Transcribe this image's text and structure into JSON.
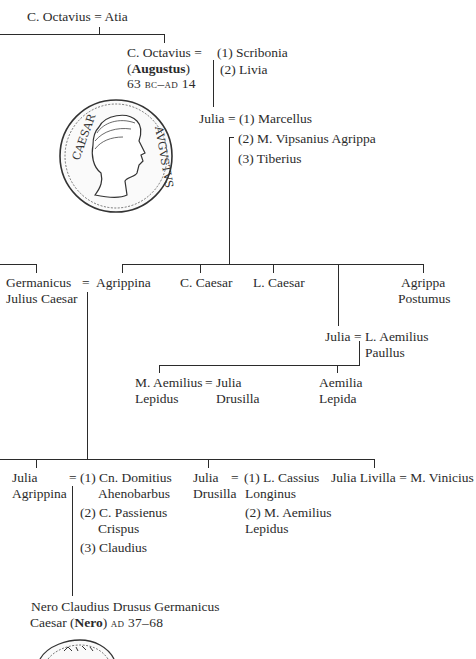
{
  "gen1": {
    "father": "C. Octavius",
    "eq": "=",
    "mother": "Atia"
  },
  "augustus": {
    "name": "C. Octavius",
    "eq": "=",
    "title_open": "(",
    "title": "Augustus",
    "title_close": ")",
    "dates": "63 bc–ad 14",
    "wives": [
      "(1) Scribonia",
      "(2) Livia"
    ]
  },
  "julia": {
    "name": "Julia",
    "eq": "=",
    "husbands": [
      "(1) Marcellus",
      "(2) M. Vipsanius Agrippa",
      "(3) Tiberius"
    ]
  },
  "coin_top": {
    "legend_left": "CAESAR",
    "legend_right": "AVGVSTVS",
    "subject": "Augustus portrait coin"
  },
  "gen3": {
    "germanicus": [
      "Germanicus",
      "Julius Caesar"
    ],
    "eq": "=",
    "agrippina": "Agrippina",
    "c_caesar": "C. Caesar",
    "l_caesar": "L. Caesar",
    "agrippa_postumus": [
      "Agrippa",
      "Postumus"
    ]
  },
  "julia_minor": {
    "name": "Julia",
    "eq": "=",
    "husband": [
      "L. Aemilius",
      "Paullus"
    ]
  },
  "gen4b": {
    "lepidus": [
      "M. Aemilius",
      "Lepidus"
    ],
    "eq": "=",
    "drusilla": [
      "Julia",
      "Drusilla"
    ],
    "aemilia": [
      "Aemilia",
      "Lepida"
    ]
  },
  "gen4": {
    "agrippina_minor": [
      "Julia",
      "Agrippina"
    ],
    "eq1": "=",
    "agrippina_husbands": [
      "(1) Cn. Domitius",
      "Ahenobarbus",
      "(2) C. Passienus",
      "Crispus",
      "(3) Claudius"
    ],
    "drusilla": [
      "Julia",
      "Drusilla"
    ],
    "eq2": "=",
    "drusilla_husbands": [
      "(1) L. Cassius",
      "Longinus",
      "(2) M. Aemilius",
      "Lepidus"
    ],
    "livilla": "Julia Livilla",
    "eq3": "=",
    "livilla_husband": "M. Vinicius"
  },
  "nero": {
    "line1": "Nero Claudius Drusus Germanicus",
    "line2_pre": "Caesar (",
    "title": "Nero",
    "line2_post": ")",
    "dates": "ad 37–68"
  }
}
